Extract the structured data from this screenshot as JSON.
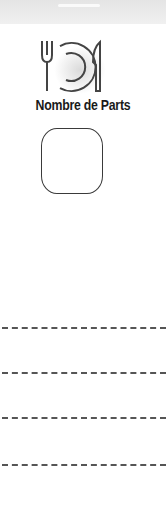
{
  "header": {
    "band": ""
  },
  "icon": {
    "name": "plate-fork-knife-icon"
  },
  "title": "Nombre de Parts",
  "input": {
    "value": ""
  },
  "lines": [
    {
      "value": ""
    },
    {
      "value": ""
    },
    {
      "value": ""
    },
    {
      "value": ""
    }
  ],
  "colors": {
    "text": "#1a1a1a",
    "border": "#3a3a3a",
    "dash": "#555555"
  }
}
